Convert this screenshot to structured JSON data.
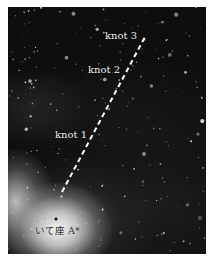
{
  "image": {
    "subject": "Galactic center star field with jet knots",
    "colors": {
      "background": "#0e0e0e",
      "jet_line": "#ffffff",
      "labels_light": "#f2f2f2",
      "label_dark": "#2a2a2a"
    }
  },
  "annotations": {
    "knot_3": "knot 3",
    "knot_2": "knot 2",
    "knot_1": "knot 1",
    "source": "いて座 A*"
  }
}
